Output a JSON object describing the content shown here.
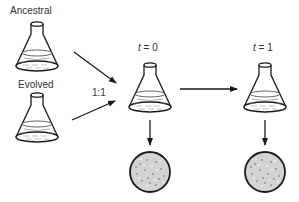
{
  "labels": {
    "ancestral": "Ancestral",
    "evolved": "Evolved",
    "ratio": "1:1",
    "t0_var": "t",
    "t0_rest": " = 0",
    "t1_var": "t",
    "t1_rest": " = 1"
  },
  "colors": {
    "stroke": "#1a1a1a",
    "liquid_line": "#555555",
    "plate_fill": "#d3d3d3",
    "colony_dark": "#8a8a8a",
    "colony_light": "#f4f4f4"
  },
  "icons": {
    "flask": "erlenmeyer-flask-icon",
    "plate": "petri-dish-icon",
    "arrow": "arrow-icon"
  }
}
